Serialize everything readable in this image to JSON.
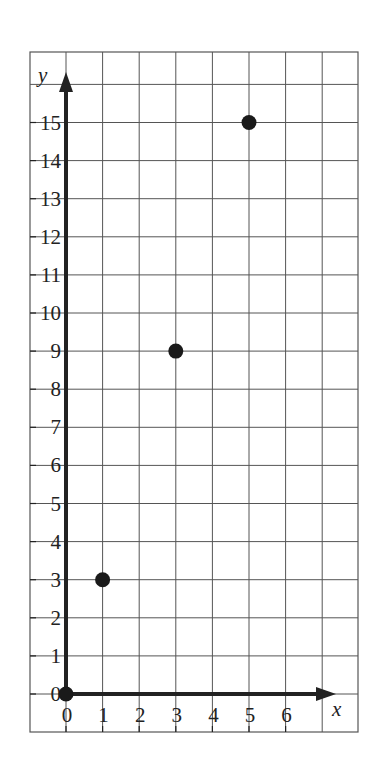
{
  "chart_data": {
    "type": "scatter",
    "title": "",
    "xlabel": "x",
    "ylabel": "y",
    "x_ticks": [
      "0",
      "1",
      "2",
      "3",
      "4",
      "5",
      "6"
    ],
    "y_ticks": [
      "0",
      "1",
      "2",
      "3",
      "4",
      "5",
      "6",
      "7",
      "8",
      "9",
      "10",
      "11",
      "12",
      "13",
      "14",
      "15"
    ],
    "xlim": [
      0,
      7
    ],
    "ylim": [
      0,
      16
    ],
    "grid": true,
    "series": [
      {
        "name": "points",
        "x": [
          0,
          1,
          3,
          5
        ],
        "y": [
          0,
          3,
          9,
          15
        ]
      }
    ]
  },
  "colors": {
    "grid": "#555555",
    "axis": "#222222",
    "point": "#1a1a1a",
    "background": "#ffffff"
  }
}
